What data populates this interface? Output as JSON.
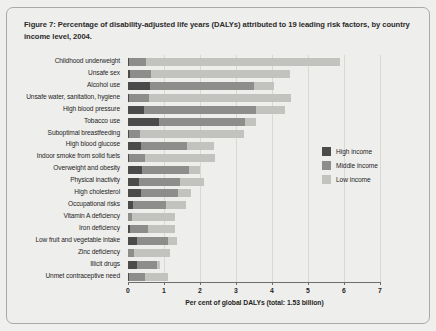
{
  "figure": {
    "title": "Figure 7: Percentage of disability-adjusted life years (DALYs) attributed to 19 leading risk factors, by country income level, 2004."
  },
  "legend": {
    "position": "right-middle",
    "items": [
      {
        "label": "High income",
        "color": "#4b4b4b",
        "key": "high"
      },
      {
        "label": "Middle income",
        "color": "#8d8d8c",
        "key": "middle"
      },
      {
        "label": "Low income",
        "color": "#c2c2bf",
        "key": "low"
      }
    ]
  },
  "chart_data": {
    "type": "bar",
    "orientation": "horizontal",
    "stacked": true,
    "title": "Figure 7: Percentage of disability-adjusted life years (DALYs) attributed to 19 leading risk factors, by country income level, 2004.",
    "xlabel": "Per cent of global DALYs (total: 1.53 billion)",
    "ylabel": "",
    "xlim": [
      0,
      7
    ],
    "xticks": [
      0,
      1,
      2,
      3,
      4,
      5,
      6,
      7
    ],
    "xtick_labels": [
      "0",
      "1",
      "2",
      "3",
      "4",
      "5",
      "6",
      "7"
    ],
    "grid": true,
    "categories": [
      "Childhood underweight",
      "Unsafe sex",
      "Alcohol use",
      "Unsafe water, sanitation, hygiene",
      "High blood pressure",
      "Tobacco use",
      "Suboptimal breastfeeding",
      "High blood glucose",
      "Indoor smoke from solid fuels",
      "Overweight and obesity",
      "Physical inactivity",
      "High cholesterol",
      "Occupational risks",
      "Vitamin A deficiency",
      "Iron deficiency",
      "Low fruit and vegetable intake",
      "Zinc deficiency",
      "Illicit drugs",
      "Unmet contraceptive need"
    ],
    "series": [
      {
        "name": "High income",
        "color": "#4b4b4b",
        "values": [
          0.02,
          0.05,
          0.6,
          0.02,
          0.45,
          0.85,
          0.02,
          0.35,
          0.02,
          0.4,
          0.3,
          0.35,
          0.15,
          0.01,
          0.05,
          0.25,
          0.01,
          0.25,
          0.02
        ]
      },
      {
        "name": "Middle income",
        "color": "#8d8d8c",
        "values": [
          0.48,
          0.6,
          2.9,
          0.55,
          3.1,
          2.4,
          0.3,
          1.3,
          0.45,
          1.3,
          1.15,
          1.05,
          0.9,
          0.1,
          0.5,
          0.85,
          0.15,
          0.55,
          0.45
        ]
      },
      {
        "name": "Low income",
        "color": "#c2c2bf",
        "values": [
          5.4,
          3.85,
          0.55,
          3.95,
          0.8,
          0.3,
          2.9,
          0.75,
          1.95,
          0.3,
          0.65,
          0.35,
          0.55,
          1.2,
          0.75,
          0.25,
          1.0,
          0.1,
          0.65
        ]
      }
    ],
    "totals": [
      5.9,
      4.5,
      4.05,
      4.52,
      4.35,
      3.55,
      3.22,
      2.4,
      2.42,
      2.0,
      2.1,
      1.75,
      1.6,
      1.31,
      1.3,
      1.35,
      1.16,
      0.9,
      1.12
    ]
  }
}
